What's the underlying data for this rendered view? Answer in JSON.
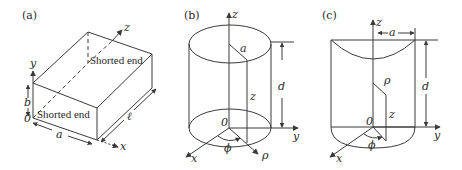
{
  "panels": [
    {
      "label": "(a)",
      "shape": "rectangular cavity",
      "axes": {
        "x": "x",
        "y": "y",
        "z": "z"
      },
      "origin": "0",
      "dims": {
        "width": "a",
        "height": "b",
        "length": "ℓ"
      },
      "annotations": [
        "Shorted end",
        "Shorted end"
      ]
    },
    {
      "label": "(b)",
      "shape": "circular cylindrical cavity",
      "axes": {
        "x": "x",
        "y": "y",
        "z": "z",
        "rho": "ρ",
        "phi": "ϕ"
      },
      "origin": "0",
      "dims": {
        "radius": "a",
        "height": "d",
        "z": "z"
      }
    },
    {
      "label": "(c)",
      "shape": "half cylindrical cavity",
      "axes": {
        "x": "x",
        "y": "y",
        "z": "z",
        "rho": "ρ",
        "phi": "ϕ"
      },
      "origin": "0",
      "dims": {
        "radius": "a",
        "height": "d",
        "z": "z"
      }
    }
  ]
}
